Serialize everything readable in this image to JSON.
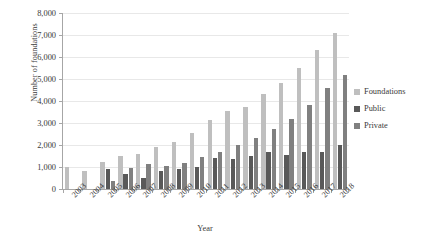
{
  "chart_data": {
    "type": "bar",
    "title": "",
    "xlabel": "Year",
    "ylabel": "Number of foundations",
    "ylim": [
      0,
      8000
    ],
    "ytick_step": 1000,
    "grid": true,
    "legend_position": "right",
    "categories": [
      "2003",
      "2004",
      "2005",
      "2006",
      "2007",
      "2008",
      "2009",
      "2010",
      "2011",
      "2012",
      "2013",
      "2014",
      "2015",
      "2016",
      "2017",
      "2018"
    ],
    "ytick_labels": [
      "8,000",
      "7,000",
      "6,000",
      "5,000",
      "4,000",
      "3,000",
      "2,000",
      "1,000",
      "0"
    ],
    "series": [
      {
        "name": "Foundations",
        "color": "#bfbfbf",
        "values": [
          1000,
          800,
          1250,
          1500,
          1600,
          1900,
          2150,
          2550,
          3150,
          3550,
          3750,
          4300,
          4800,
          5500,
          6300,
          7100
        ]
      },
      {
        "name": "Public",
        "color": "#595959",
        "values": [
          0,
          0,
          900,
          700,
          500,
          800,
          900,
          1000,
          1400,
          1350,
          1500,
          1700,
          1550,
          1700,
          1700,
          2000
        ]
      },
      {
        "name": "Private",
        "color": "#808080",
        "values": [
          0,
          0,
          350,
          950,
          1150,
          1050,
          1200,
          1450,
          1700,
          2000,
          2300,
          2750,
          3200,
          3800,
          4600,
          5200
        ]
      }
    ]
  },
  "legend": {
    "items": [
      {
        "label": "Foundations"
      },
      {
        "label": "Public"
      },
      {
        "label": "Private"
      }
    ]
  },
  "axes": {
    "x_title": "Year",
    "y_title": "Number of foundations"
  }
}
